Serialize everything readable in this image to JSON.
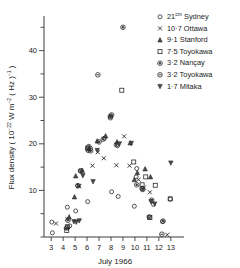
{
  "chart_data": {
    "type": "scatter",
    "title": "",
    "xlabel": "July 1966",
    "ylabel": "Flux density ( 10-22 W m-2 ( Hz )-1 )",
    "ylabel_parts": {
      "lead": "Flux density ( 10",
      "exp1": "−22",
      "mid": " W m",
      "exp2": "−2",
      "mid2": " ( Hz )",
      "exp3": "−1",
      "tail": " )"
    },
    "xlim": [
      2.4,
      13.6
    ],
    "ylim": [
      0,
      47
    ],
    "xticks": [
      3,
      4,
      5,
      6,
      7,
      8,
      9,
      10,
      11,
      12,
      13
    ],
    "xticklabels": [
      "3",
      "4",
      "5",
      "6",
      "7",
      "8",
      "9",
      "10",
      "11",
      "12",
      "13"
    ],
    "yticks": [
      0,
      5,
      10,
      15,
      20,
      25,
      30,
      35,
      40,
      45
    ],
    "ylabelled_ticks": [
      10,
      20,
      30,
      40
    ],
    "yticklabels": [
      "10",
      "20",
      "30",
      "40"
    ],
    "grid": false,
    "legend_position": "top-right",
    "series": [
      {
        "name": "Sydney",
        "freq_label": "21",
        "freq_sup": "cm",
        "legend": "21cm Sydney",
        "marker": "circle-open",
        "points": [
          [
            3.05,
            3.2
          ],
          [
            3.1,
            0.9
          ],
          [
            4.25,
            1.9
          ],
          [
            4.35,
            6.4
          ],
          [
            5.05,
            5.6
          ],
          [
            5.2,
            11.0
          ],
          [
            6.05,
            7.6
          ],
          [
            6.3,
            19.0
          ],
          [
            7.45,
            21.2
          ],
          [
            8.05,
            9.7
          ],
          [
            8.55,
            19.6
          ],
          [
            8.6,
            8.7
          ],
          [
            9.95,
            6.6
          ],
          [
            10.1,
            12.9
          ],
          [
            10.15,
            14.7
          ],
          [
            11.55,
            7.0
          ],
          [
            12.3,
            3.3
          ],
          [
            12.95,
            8.1
          ],
          [
            4.55,
            2.4
          ],
          [
            5.45,
            14.2
          ]
        ]
      },
      {
        "name": "Ottawa",
        "freq_label": "10·7",
        "legend": "10·7 Ottawa",
        "marker": "x",
        "points": [
          [
            3.4,
            2.9
          ],
          [
            4.35,
            3.9
          ],
          [
            5.3,
            11.0
          ],
          [
            5.35,
            10.9
          ],
          [
            6.45,
            15.3
          ],
          [
            7.4,
            16.9
          ],
          [
            8.45,
            15.4
          ],
          [
            9.55,
            15.3
          ],
          [
            10.3,
            12.3
          ],
          [
            10.75,
            10.6
          ],
          [
            11.2,
            4.1
          ],
          [
            11.25,
            9.6
          ],
          [
            12.7,
            0.5
          ],
          [
            6.9,
            18.2
          ],
          [
            9.1,
            21.6
          ]
        ]
      },
      {
        "name": "Stanford",
        "freq_label": "9·1",
        "legend": "9·1 Stanford",
        "marker": "triangle-up",
        "points": [
          [
            4.95,
            8.6
          ],
          [
            5.05,
            13.1
          ],
          [
            5.6,
            14.3
          ],
          [
            6.85,
            20.6
          ],
          [
            7.55,
            21.7
          ],
          [
            8.5,
            20.4
          ],
          [
            9.6,
            20.2
          ],
          [
            10.2,
            13.8
          ],
          [
            10.85,
            14.6
          ],
          [
            11.3,
            12.9
          ],
          [
            4.5,
            4.3
          ],
          [
            9.95,
            12.3
          ]
        ]
      },
      {
        "name": "Toyokawa 7·5",
        "freq_label": "7·5",
        "legend": "7·5 Toyokawa",
        "marker": "square-open",
        "points": [
          [
            4.3,
            1.4
          ],
          [
            4.35,
            2.2
          ],
          [
            8.9,
            31.5
          ],
          [
            9.9,
            16.1
          ],
          [
            10.9,
            12.9
          ],
          [
            11.7,
            11.1
          ],
          [
            11.25,
            4.2
          ],
          [
            12.95,
            8.2
          ],
          [
            10.6,
            11.2
          ],
          [
            6.05,
            19.1
          ]
        ]
      },
      {
        "name": "Nançay",
        "freq_label": "3·2",
        "legend": "3·2 Nançay",
        "marker": "circle-dot",
        "points": [
          [
            4.4,
            3.6
          ],
          [
            5.25,
            11.0
          ],
          [
            5.45,
            14.2
          ],
          [
            6.1,
            18.9
          ],
          [
            6.3,
            18.5
          ],
          [
            7.0,
            20.4
          ],
          [
            7.35,
            21.0
          ],
          [
            7.95,
            25.9
          ],
          [
            8.45,
            19.8
          ],
          [
            9.0,
            45.0
          ],
          [
            10.15,
            11.2
          ],
          [
            10.65,
            10.2
          ],
          [
            11.4,
            7.9
          ],
          [
            12.35,
            3.4
          ],
          [
            8.05,
            26.2
          ],
          [
            6.15,
            19.4
          ]
        ]
      },
      {
        "name": "Toyokawa 3·2",
        "freq_label": "3·2",
        "legend": "3·2 Toyokawa",
        "marker": "circle-bar",
        "points": [
          [
            4.35,
            2.0
          ],
          [
            6.9,
            34.8
          ],
          [
            7.95,
            25.6
          ],
          [
            6.1,
            18.6
          ],
          [
            11.2,
            4.3
          ],
          [
            12.25,
            0.6
          ],
          [
            10.6,
            10.4
          ]
        ]
      },
      {
        "name": "Mitaka",
        "freq_label": "1·7",
        "legend": "1·7 Mitaka",
        "marker": "triangle-down",
        "points": [
          [
            4.9,
            3.3
          ],
          [
            5.35,
            3.5
          ],
          [
            5.65,
            13.2
          ],
          [
            6.5,
            11.9
          ],
          [
            6.85,
            18.6
          ],
          [
            8.7,
            20.0
          ],
          [
            9.7,
            20.1
          ],
          [
            11.35,
            7.6
          ],
          [
            11.65,
            7.1
          ],
          [
            13.0,
            15.9
          ],
          [
            5.1,
            3.2
          ]
        ]
      }
    ]
  },
  "axes": {
    "x_title": "July 1966",
    "y_title_lead": "Flux density ( 10",
    "y_sup_22": "−22",
    "y_mid_wm": " W m",
    "y_sup_2": "−2",
    "y_mid_hz": " ( Hz )",
    "y_sup_1": "−1",
    "y_tail": " )"
  },
  "colors": {
    "ink": "#1a1a1a",
    "axis": "#3a3a3a",
    "marker": "#2a2a2a",
    "background": "#ffffff"
  }
}
